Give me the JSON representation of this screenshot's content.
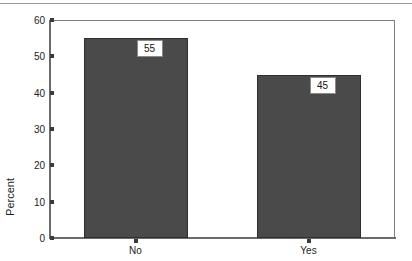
{
  "chart_data": {
    "type": "bar",
    "title": "",
    "xlabel": "",
    "ylabel": "Percent",
    "categories": [
      "No",
      "Yes"
    ],
    "values": [
      55,
      45
    ],
    "data_labels": [
      "55",
      "45"
    ],
    "ylim": [
      0,
      60
    ],
    "yticks": [
      0,
      10,
      20,
      30,
      40,
      50,
      60
    ],
    "ytick_labels": [
      "0",
      "10",
      "20",
      "30",
      "40",
      "50",
      "60"
    ],
    "grid": false,
    "legend": null,
    "bar_color": "#4a4a4a",
    "bar_edge_color": "#2e2e2e",
    "frame_color": "#7d7d7d",
    "axis_color": "#6b6b6b",
    "label_box_fill": "#ffffff",
    "label_box_border": "#8a8a8a",
    "text_color": "#1c1c1c"
  }
}
